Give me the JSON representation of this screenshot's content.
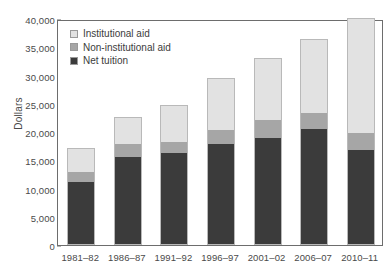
{
  "chart_data": {
    "type": "bar",
    "subtype": "stacked-vertical",
    "title": "",
    "subtitle": "",
    "xlabel": "",
    "ylabel": "Dollars",
    "categories": [
      "1981–82",
      "1986–87",
      "1991–92",
      "1996–97",
      "2001–02",
      "2006–07",
      "2010–11"
    ],
    "series": [
      {
        "name": "Net tuition",
        "color": "#3b3b3b",
        "values": [
          11100,
          15600,
          16200,
          17900,
          19000,
          20500,
          16800
        ]
      },
      {
        "name": "Non-institutional aid",
        "color": "#a6a6a6",
        "values": [
          1900,
          2300,
          2000,
          2500,
          3200,
          2900,
          3000
        ]
      },
      {
        "name": "Institutional aid",
        "color": "#e2e2e2",
        "values": [
          4100,
          4700,
          6600,
          9100,
          10900,
          13100,
          20300
        ]
      }
    ],
    "stack_order_bottom_to_top": [
      "Net tuition",
      "Non-institutional aid",
      "Institutional aid"
    ],
    "totals": [
      17100,
      22600,
      24800,
      29500,
      33100,
      36500,
      40100
    ],
    "ylim": [
      0,
      40000
    ],
    "ytick_step": 5000,
    "yticks": [
      "0",
      "5,000",
      "10,000",
      "15,000",
      "20,000",
      "25,000",
      "30,000",
      "35,000",
      "40,000"
    ],
    "ytick_values": [
      0,
      5000,
      10000,
      15000,
      20000,
      25000,
      30000,
      35000,
      40000
    ],
    "grid": false,
    "legend_position": "inside-top-left",
    "legend_entries": [
      {
        "label": "Institutional aid",
        "color": "#e2e2e2"
      },
      {
        "label": "Non-institutional aid",
        "color": "#a6a6a6"
      },
      {
        "label": "Net tuition",
        "color": "#3b3b3b"
      }
    ],
    "frame": true
  }
}
